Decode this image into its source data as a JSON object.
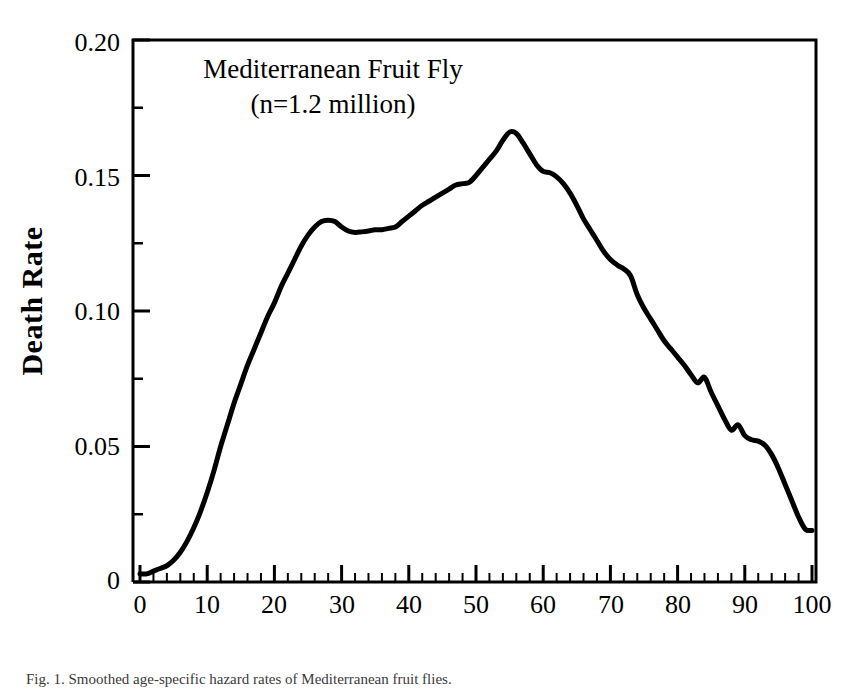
{
  "chart_data": {
    "type": "line",
    "title": "",
    "annotation_lines": [
      "Mediterranean Fruit Fly",
      "(n=1.2 million)"
    ],
    "xlabel": "Age (Days)",
    "ylabel": "Death Rate",
    "xlim": [
      0,
      100
    ],
    "ylim": [
      0,
      0.2
    ],
    "grid": false,
    "legend": "none",
    "x_major_ticks": [
      0,
      10,
      20,
      30,
      40,
      50,
      60,
      70,
      80,
      90,
      100
    ],
    "x_tick_labels": [
      "0",
      "10",
      "20",
      "30",
      "40",
      "50",
      "60",
      "70",
      "80",
      "90",
      "100"
    ],
    "x_minor_tick_step": 2,
    "y_major_ticks": [
      0,
      0.05,
      0.1,
      0.15,
      0.2
    ],
    "y_tick_labels": [
      "0",
      "0.05",
      "0.10",
      "0.15",
      "0.20"
    ],
    "y_minor_ticks": [
      0.025,
      0.075,
      0.125,
      0.175
    ],
    "line_color": "#000000",
    "line_width": 5,
    "series": [
      {
        "name": "Death Rate",
        "x": [
          0,
          1,
          2,
          3,
          4,
          5,
          6,
          7,
          8,
          9,
          10,
          11,
          12,
          13,
          14,
          15,
          16,
          17,
          18,
          19,
          20,
          21,
          22,
          23,
          24,
          25,
          26,
          27,
          28,
          29,
          30,
          31,
          32,
          33,
          34,
          35,
          36,
          37,
          38,
          39,
          40,
          41,
          42,
          43,
          44,
          45,
          46,
          47,
          48,
          49,
          50,
          51,
          52,
          53,
          54,
          55,
          56,
          57,
          58,
          59,
          60,
          61,
          62,
          63,
          64,
          65,
          66,
          67,
          68,
          69,
          70,
          71,
          72,
          73,
          74,
          75,
          76,
          77,
          78,
          79,
          80,
          81,
          82,
          83,
          84,
          85,
          86,
          87,
          88,
          89,
          90,
          91,
          92,
          93,
          94,
          95,
          96,
          97,
          98,
          99,
          100
        ],
        "values": [
          0.003,
          0.003,
          0.004,
          0.005,
          0.006,
          0.008,
          0.011,
          0.015,
          0.02,
          0.026,
          0.033,
          0.041,
          0.05,
          0.058,
          0.066,
          0.073,
          0.08,
          0.086,
          0.092,
          0.098,
          0.103,
          0.109,
          0.114,
          0.119,
          0.124,
          0.128,
          0.131,
          0.133,
          0.1335,
          0.133,
          0.131,
          0.1295,
          0.129,
          0.1292,
          0.1295,
          0.13,
          0.13,
          0.1305,
          0.131,
          0.133,
          0.135,
          0.137,
          0.139,
          0.1405,
          0.142,
          0.1435,
          0.145,
          0.1465,
          0.147,
          0.1475,
          0.15,
          0.153,
          0.156,
          0.159,
          0.163,
          0.166,
          0.1655,
          0.162,
          0.158,
          0.154,
          0.1515,
          0.151,
          0.1495,
          0.147,
          0.1435,
          0.139,
          0.134,
          0.13,
          0.126,
          0.122,
          0.119,
          0.117,
          0.1155,
          0.113,
          0.106,
          0.101,
          0.097,
          0.093,
          0.089,
          0.086,
          0.083,
          0.08,
          0.0765,
          0.0735,
          0.0755,
          0.07,
          0.065,
          0.06,
          0.056,
          0.058,
          0.054,
          0.0525,
          0.052,
          0.0505,
          0.047,
          0.042,
          0.036,
          0.03,
          0.024,
          0.0195,
          0.019
        ]
      }
    ]
  },
  "figure": {
    "caption": "Fig. 1. Smoothed age-specific hazard rates of Mediterranean fruit flies."
  }
}
